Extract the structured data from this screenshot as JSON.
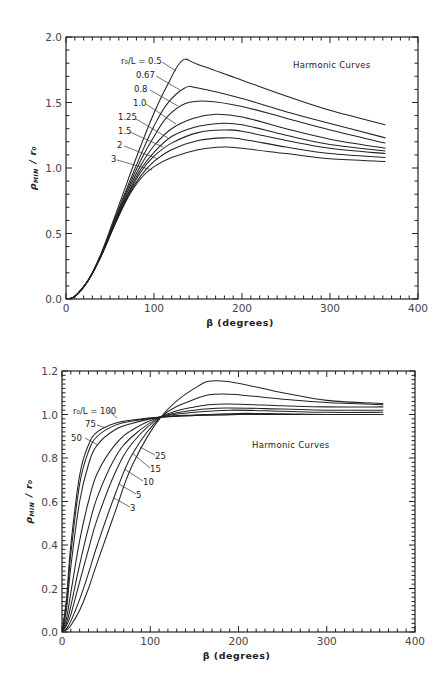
{
  "chart_data": [
    {
      "type": "line",
      "title": "",
      "annotation": "Harmonic Curves",
      "xlabel": "β (degrees)",
      "ylabel": "ρ_MIN / r₀",
      "xlim": [
        0,
        400
      ],
      "ylim": [
        0.0,
        2.0
      ],
      "xticks": [
        0,
        100,
        200,
        300,
        400
      ],
      "yticks": [
        0.0,
        0.5,
        1.0,
        1.5,
        2.0
      ],
      "ytick_labels": [
        "0.0",
        "0.5",
        "1.0",
        "1.5",
        "2.0"
      ],
      "legend_param": "r₀/L",
      "series": [
        {
          "name": "r₀/L = 0.5",
          "label": "r₀/L = 0.5",
          "x": [
            0,
            10,
            25,
            40,
            55,
            70,
            85,
            100,
            115,
            132,
            150,
            200,
            250,
            300,
            363
          ],
          "y": [
            0,
            0.02,
            0.14,
            0.35,
            0.62,
            0.9,
            1.17,
            1.42,
            1.63,
            1.82,
            1.79,
            1.67,
            1.55,
            1.44,
            1.33
          ]
        },
        {
          "name": "r₀/L = 0.67",
          "label": "0.67",
          "x": [
            0,
            10,
            25,
            40,
            55,
            70,
            85,
            100,
            115,
            135,
            150,
            200,
            250,
            300,
            363
          ],
          "y": [
            0,
            0.02,
            0.14,
            0.34,
            0.6,
            0.86,
            1.1,
            1.32,
            1.49,
            1.61,
            1.61,
            1.53,
            1.43,
            1.34,
            1.23
          ]
        },
        {
          "name": "r₀/L = 0.8",
          "label": "0.8",
          "x": [
            0,
            10,
            25,
            40,
            55,
            70,
            85,
            100,
            115,
            135,
            160,
            200,
            250,
            300,
            363
          ],
          "y": [
            0,
            0.02,
            0.14,
            0.34,
            0.59,
            0.84,
            1.06,
            1.24,
            1.39,
            1.49,
            1.51,
            1.47,
            1.38,
            1.29,
            1.19
          ]
        },
        {
          "name": "r₀/L = 1.0",
          "label": "1.0",
          "x": [
            0,
            10,
            25,
            40,
            55,
            70,
            85,
            100,
            120,
            145,
            170,
            200,
            250,
            300,
            363
          ],
          "y": [
            0,
            0.02,
            0.14,
            0.33,
            0.58,
            0.82,
            1.02,
            1.17,
            1.3,
            1.38,
            1.41,
            1.39,
            1.3,
            1.22,
            1.15
          ]
        },
        {
          "name": "r₀/L = 1.25",
          "label": "1.25",
          "x": [
            0,
            10,
            25,
            40,
            55,
            70,
            85,
            100,
            120,
            145,
            175,
            200,
            250,
            300,
            363
          ],
          "y": [
            0,
            0.02,
            0.14,
            0.33,
            0.57,
            0.8,
            0.99,
            1.12,
            1.24,
            1.31,
            1.34,
            1.33,
            1.25,
            1.18,
            1.13
          ]
        },
        {
          "name": "r₀/L = 1.5",
          "label": "1.5",
          "x": [
            0,
            10,
            25,
            40,
            55,
            70,
            85,
            100,
            120,
            150,
            180,
            200,
            250,
            300,
            363
          ],
          "y": [
            0,
            0.02,
            0.14,
            0.33,
            0.57,
            0.79,
            0.97,
            1.09,
            1.19,
            1.27,
            1.29,
            1.28,
            1.21,
            1.15,
            1.11
          ]
        },
        {
          "name": "r₀/L = 2",
          "label": "2",
          "x": [
            0,
            10,
            25,
            40,
            55,
            70,
            85,
            100,
            120,
            150,
            180,
            200,
            250,
            300,
            363
          ],
          "y": [
            0,
            0.02,
            0.14,
            0.33,
            0.56,
            0.78,
            0.94,
            1.05,
            1.14,
            1.21,
            1.23,
            1.22,
            1.16,
            1.11,
            1.08
          ]
        },
        {
          "name": "r₀/L = 3",
          "label": "3",
          "x": [
            0,
            10,
            25,
            40,
            55,
            70,
            85,
            100,
            120,
            150,
            180,
            200,
            250,
            300,
            363
          ],
          "y": [
            0,
            0.02,
            0.14,
            0.33,
            0.56,
            0.77,
            0.92,
            1.01,
            1.08,
            1.14,
            1.16,
            1.15,
            1.11,
            1.07,
            1.05
          ]
        }
      ]
    },
    {
      "type": "line",
      "title": "",
      "annotation": "Harmonic Curves",
      "xlabel": "β (degrees)",
      "ylabel": "ρ_MIN / r₀",
      "xlim": [
        0,
        400
      ],
      "ylim": [
        0.0,
        1.2
      ],
      "xticks": [
        0,
        100,
        200,
        300,
        400
      ],
      "yticks": [
        0.0,
        0.2,
        0.4,
        0.6,
        0.8,
        1.0,
        1.2
      ],
      "ytick_labels": [
        "0.0",
        "0.2",
        "0.4",
        "0.6",
        "0.8",
        "1.0",
        "1.2"
      ],
      "legend_param": "r₀/L",
      "series": [
        {
          "name": "r₀/L = 100",
          "label": "r₀/L = 100",
          "x": [
            0,
            5,
            10,
            20,
            30,
            40,
            60,
            80,
            112,
            150,
            200,
            250,
            300,
            364
          ],
          "y": [
            0,
            0.15,
            0.4,
            0.72,
            0.86,
            0.92,
            0.96,
            0.975,
            0.988,
            0.995,
            1.0,
            1.0,
            1.0,
            1.0
          ]
        },
        {
          "name": "r₀/L = 75",
          "label": "75",
          "x": [
            0,
            5,
            10,
            20,
            30,
            40,
            60,
            80,
            112,
            150,
            200,
            250,
            300,
            364
          ],
          "y": [
            0,
            0.13,
            0.36,
            0.68,
            0.83,
            0.9,
            0.95,
            0.97,
            0.988,
            0.996,
            1.0,
            1.0,
            1.0,
            1.0
          ]
        },
        {
          "name": "r₀/L = 50",
          "label": "50",
          "x": [
            0,
            5,
            10,
            20,
            30,
            40,
            60,
            80,
            112,
            150,
            200,
            250,
            300,
            364
          ],
          "y": [
            0,
            0.1,
            0.3,
            0.6,
            0.77,
            0.86,
            0.93,
            0.96,
            0.988,
            0.998,
            1.005,
            1.003,
            1.0,
            1.0
          ]
        },
        {
          "name": "r₀/L = 25",
          "label": "25",
          "x": [
            0,
            5,
            10,
            20,
            30,
            40,
            60,
            80,
            112,
            150,
            190,
            250,
            300,
            364
          ],
          "y": [
            0,
            0.06,
            0.18,
            0.42,
            0.6,
            0.73,
            0.86,
            0.93,
            0.988,
            1.01,
            1.02,
            1.015,
            1.01,
            1.01
          ]
        },
        {
          "name": "r₀/L = 15",
          "label": "15",
          "x": [
            0,
            5,
            10,
            20,
            30,
            40,
            60,
            80,
            112,
            150,
            185,
            250,
            300,
            364
          ],
          "y": [
            0,
            0.04,
            0.12,
            0.31,
            0.48,
            0.62,
            0.8,
            0.9,
            0.988,
            1.02,
            1.03,
            1.025,
            1.02,
            1.02
          ]
        },
        {
          "name": "r₀/L = 10",
          "label": "10",
          "x": [
            0,
            5,
            10,
            20,
            30,
            40,
            60,
            80,
            112,
            150,
            185,
            250,
            300,
            364
          ],
          "y": [
            0,
            0.03,
            0.08,
            0.23,
            0.38,
            0.52,
            0.73,
            0.87,
            0.988,
            1.035,
            1.048,
            1.04,
            1.035,
            1.035
          ]
        },
        {
          "name": "r₀/L = 5",
          "label": "5",
          "x": [
            0,
            5,
            10,
            20,
            30,
            40,
            60,
            80,
            112,
            150,
            183,
            250,
            300,
            364
          ],
          "y": [
            0,
            0.015,
            0.05,
            0.15,
            0.27,
            0.4,
            0.63,
            0.82,
            0.988,
            1.07,
            1.094,
            1.07,
            1.055,
            1.045
          ]
        },
        {
          "name": "r₀/L = 3",
          "label": "3",
          "x": [
            0,
            5,
            10,
            20,
            30,
            40,
            60,
            80,
            112,
            150,
            181,
            250,
            300,
            364
          ],
          "y": [
            0,
            0.01,
            0.03,
            0.1,
            0.2,
            0.32,
            0.55,
            0.77,
            0.988,
            1.12,
            1.154,
            1.1,
            1.065,
            1.05
          ]
        }
      ]
    }
  ],
  "charts": {
    "top": {
      "annotation": "Harmonic Curves",
      "xlabel": "β (degrees)",
      "ylabel_main": "ρ",
      "ylabel_sub": "MIN",
      "ylabel_tail": "/ r₀"
    },
    "bottom": {
      "annotation": "Harmonic Curves",
      "xlabel": "β (degrees)",
      "ylabel_main": "ρ",
      "ylabel_sub": "MIN",
      "ylabel_tail": "/ r₀"
    }
  }
}
